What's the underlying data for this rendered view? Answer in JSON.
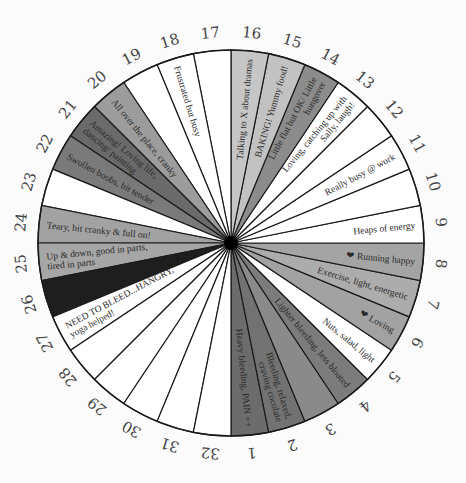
{
  "chart": {
    "title": "",
    "center": [
      231,
      243
    ],
    "radius": 193,
    "segment_count": 32,
    "segments": [
      {
        "day": "1",
        "color": "#6c6c6c",
        "lines": [
          "Heavy bleeding, PAIN ++"
        ]
      },
      {
        "day": "2",
        "color": "#727272",
        "lines": [
          "Bleeding, relaxed,",
          "craving cocolate"
        ]
      },
      {
        "day": "3",
        "color": "#8a8a8a",
        "lines": []
      },
      {
        "day": "4",
        "color": "#7c7c7c",
        "lines": [
          "Lighter bleeding, less bloated"
        ]
      },
      {
        "day": "5",
        "color": "#ffffff",
        "lines": [
          "Nuts, salad, light"
        ]
      },
      {
        "day": "6",
        "color": "#a2a2a2",
        "lines": [
          "❤ Loving"
        ]
      },
      {
        "day": "7",
        "color": "#acacac",
        "lines": [
          "Exercise, light, energetic"
        ]
      },
      {
        "day": "8",
        "color": "#a4a4a4",
        "lines": [
          "❤ Running happy"
        ]
      },
      {
        "day": "9",
        "color": "#ffffff",
        "lines": [
          "Heaps of energy"
        ]
      },
      {
        "day": "10",
        "color": "#ffffff",
        "lines": []
      },
      {
        "day": "11",
        "color": "#ffffff",
        "lines": [
          "Really busy @ work"
        ]
      },
      {
        "day": "12",
        "color": "#ffffff",
        "lines": []
      },
      {
        "day": "13",
        "color": "#ffffff",
        "lines": [
          "Loving, catching up with",
          "Sally, laugh!"
        ]
      },
      {
        "day": "14",
        "color": "#8c8c8c",
        "lines": [
          "Little flat but OK/ Little",
          "hungover"
        ]
      },
      {
        "day": "15",
        "color": "#c2c2c2",
        "lines": [
          "BAKING! Yummy food!"
        ]
      },
      {
        "day": "16",
        "color": "#c6c6c6",
        "lines": [
          "Talking to X about dramas"
        ]
      },
      {
        "day": "17",
        "color": "#ffffff",
        "lines": []
      },
      {
        "day": "18",
        "color": "#ffffff",
        "lines": [
          "Frustrated but busy"
        ]
      },
      {
        "day": "19",
        "color": "#ffffff",
        "lines": []
      },
      {
        "day": "20",
        "color": "#9c9c9c",
        "lines": [
          "All over the place, cranky"
        ]
      },
      {
        "day": "21",
        "color": "#6a6a6a",
        "lines": [
          "Amazing! Loving life,",
          "dancing/ painting"
        ]
      },
      {
        "day": "22",
        "color": "#7a7a7a",
        "lines": [
          "Swollen boobs, bit tender"
        ]
      },
      {
        "day": "23",
        "color": "#ffffff",
        "lines": []
      },
      {
        "day": "24",
        "color": "#a2a2a2",
        "lines": [
          "Teary, bit cranky & full on!"
        ]
      },
      {
        "day": "25",
        "color": "#a6a6a6",
        "lines": [
          "Up & down, good in parts,",
          "tired in parts"
        ]
      },
      {
        "day": "26",
        "color": "#1e1e1e",
        "lines": []
      },
      {
        "day": "27",
        "color": "#ffffff",
        "lines": [
          "NEED TO BLEED...HANGRY,",
          "yoga helped!"
        ]
      },
      {
        "day": "28",
        "color": "#ffffff",
        "lines": []
      },
      {
        "day": "29",
        "color": "#ffffff",
        "lines": []
      },
      {
        "day": "30",
        "color": "#ffffff",
        "lines": []
      },
      {
        "day": "31",
        "color": "#ffffff",
        "lines": []
      },
      {
        "day": "32",
        "color": "#ffffff",
        "lines": []
      }
    ]
  }
}
